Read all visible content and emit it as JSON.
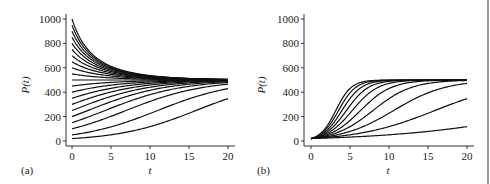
{
  "chart_data": [
    {
      "type": "line",
      "panel_label": "(a)",
      "title": "",
      "xlabel": "t",
      "ylabel": "P(t)",
      "xlim": [
        0,
        20
      ],
      "ylim": [
        0,
        1000
      ],
      "xticks": [
        0,
        5,
        10,
        15,
        20
      ],
      "yticks": [
        0,
        200,
        400,
        600,
        800,
        1000
      ],
      "grid": false,
      "legend": "none",
      "model": "logistic P(t) = K / (1 + ((K - P0)/P0) e^(-r t))",
      "K": 500,
      "r": 0.2,
      "initial_values": [
        20,
        50,
        100,
        150,
        200,
        250,
        300,
        350,
        400,
        450,
        500,
        550,
        600,
        650,
        700,
        750,
        800,
        850,
        900,
        950,
        1000
      ],
      "series_end_values_approx": {
        "P0=20": 350,
        "P0=50": 430
      }
    },
    {
      "type": "line",
      "panel_label": "(b)",
      "title": "",
      "xlabel": "t",
      "ylabel": "P(t)",
      "xlim": [
        0,
        20
      ],
      "ylim": [
        0,
        1000
      ],
      "xticks": [
        0,
        5,
        10,
        15,
        20
      ],
      "yticks": [
        0,
        200,
        400,
        600,
        800,
        1000
      ],
      "grid": false,
      "legend": "none",
      "model": "logistic P(t) = K / (1 + ((K - P0)/P0) e^(-r t))",
      "K": 500,
      "P0": 20,
      "growth_rates": [
        0.1,
        0.2,
        0.3,
        0.4,
        0.5,
        0.6,
        0.7,
        0.8,
        0.9,
        1.0
      ],
      "series_end_values_approx": {
        "r=0.1": 120,
        "r=0.2": 350,
        "r=0.3": 475
      }
    }
  ]
}
